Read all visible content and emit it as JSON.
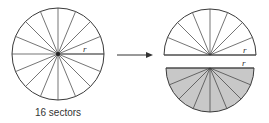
{
  "diagram": {
    "caption": "16 sectors",
    "radius_label": "r",
    "sectors": 16,
    "colors": {
      "stroke": "#3a3a3a",
      "shaded": "#c8c8c8",
      "background": "#ffffff"
    }
  }
}
